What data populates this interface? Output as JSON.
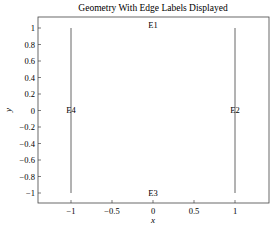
{
  "chart_data": {
    "type": "line",
    "title": "Geometry With Edge Labels Displayed",
    "xlabel": "x",
    "ylabel": "y",
    "xlim": [
      -1.4,
      1.4
    ],
    "ylim": [
      -1.1,
      1.1
    ],
    "grid": false,
    "xticks": [
      -1,
      -0.5,
      0,
      0.5,
      1
    ],
    "xtick_labels": [
      "−1",
      "−0.5",
      "0",
      "0.5",
      "1"
    ],
    "yticks": [
      1,
      0.8,
      0.6,
      0.4,
      0.2,
      0,
      -0.2,
      -0.4,
      -0.6,
      -0.8,
      -1
    ],
    "ytick_labels": [
      "1",
      "0.8",
      "0.6",
      "0.4",
      "0.2",
      "0",
      "−0.2",
      "−0.4",
      "−0.6",
      "−0.8",
      "−1"
    ],
    "series": [
      {
        "name": "E1",
        "x": [
          -1,
          1
        ],
        "y": [
          1,
          1
        ],
        "visible_line": false
      },
      {
        "name": "E2",
        "x": [
          1,
          1
        ],
        "y": [
          -1,
          1
        ],
        "visible_line": true
      },
      {
        "name": "E3",
        "x": [
          -1,
          1
        ],
        "y": [
          -1,
          -1
        ],
        "visible_line": false
      },
      {
        "name": "E4",
        "x": [
          -1,
          -1
        ],
        "y": [
          -1,
          1
        ],
        "visible_line": true
      }
    ],
    "annotations": [
      {
        "text": "E1",
        "x": 0,
        "y": 1
      },
      {
        "text": "E2",
        "x": 1,
        "y": 0
      },
      {
        "text": "E3",
        "x": 0,
        "y": -1
      },
      {
        "text": "E4",
        "x": -1,
        "y": 0
      }
    ],
    "line_color": "#555555"
  }
}
